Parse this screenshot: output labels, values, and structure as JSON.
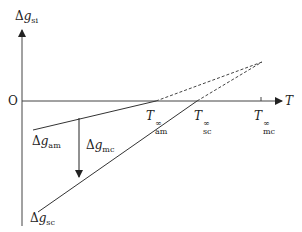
{
  "diagram": {
    "colors": {
      "line": "#333333",
      "background": "#ffffff"
    },
    "axes": {
      "origin_label": "O",
      "x_axis_label": "T",
      "y_axis_label": {
        "symbol": "Δ",
        "var": "g",
        "sub": "si"
      }
    },
    "labels": {
      "delta_g_am": {
        "symbol": "Δ",
        "var": "g",
        "sub": "am"
      },
      "delta_g_sc": {
        "symbol": "Δ",
        "var": "g",
        "sub": "sc"
      },
      "delta_g_mc": {
        "symbol": "Δ",
        "var": "g",
        "sub": "mc"
      },
      "t_am": {
        "var": "T",
        "sup": "∞",
        "sub": "am"
      },
      "t_sc": {
        "var": "T",
        "sup": "∞",
        "sub": "sc"
      },
      "t_mc": {
        "var": "T",
        "sup": "∞",
        "sub": "mc"
      }
    },
    "lines": [
      {
        "name": "delta-g-am-line",
        "solid_from": [
          33,
          130
        ],
        "solid_to": [
          156,
          101
        ],
        "dashed_to": [
          262,
          62
        ]
      },
      {
        "name": "delta-g-sc-line",
        "solid_from": [
          38,
          212
        ],
        "solid_to": [
          197,
          101
        ],
        "dashed_to": [
          262,
          62
        ]
      }
    ]
  }
}
